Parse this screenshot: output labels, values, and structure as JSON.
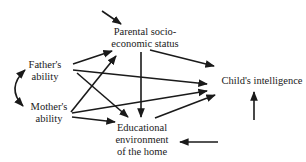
{
  "diagram": {
    "type": "path-diagram",
    "nodes": {
      "father": {
        "lines": [
          "Father's",
          "ability"
        ]
      },
      "mother": {
        "lines": [
          "Mother's",
          "ability"
        ]
      },
      "ses": {
        "lines": [
          "Parental socio-",
          "economic status"
        ]
      },
      "child": {
        "lines": [
          "Child's intelligence"
        ]
      },
      "env": {
        "lines": [
          "Educational",
          "environment",
          "of the home"
        ]
      }
    },
    "edges": [
      {
        "from": "father",
        "to": "mother",
        "kind": "curved-double-headed"
      },
      {
        "from": "father",
        "to": "ses"
      },
      {
        "from": "father",
        "to": "child"
      },
      {
        "from": "father",
        "to": "env"
      },
      {
        "from": "mother",
        "to": "ses"
      },
      {
        "from": "mother",
        "to": "child"
      },
      {
        "from": "mother",
        "to": "env"
      },
      {
        "from": "ses",
        "to": "child"
      },
      {
        "from": "ses",
        "to": "env"
      },
      {
        "from": "env",
        "to": "child"
      },
      {
        "from": "external",
        "to": "ses",
        "kind": "residual"
      },
      {
        "from": "external",
        "to": "child",
        "kind": "residual"
      },
      {
        "from": "external",
        "to": "env",
        "kind": "residual"
      }
    ],
    "colors": {
      "ink": "#1a1a1a",
      "background": "#ffffff"
    }
  }
}
